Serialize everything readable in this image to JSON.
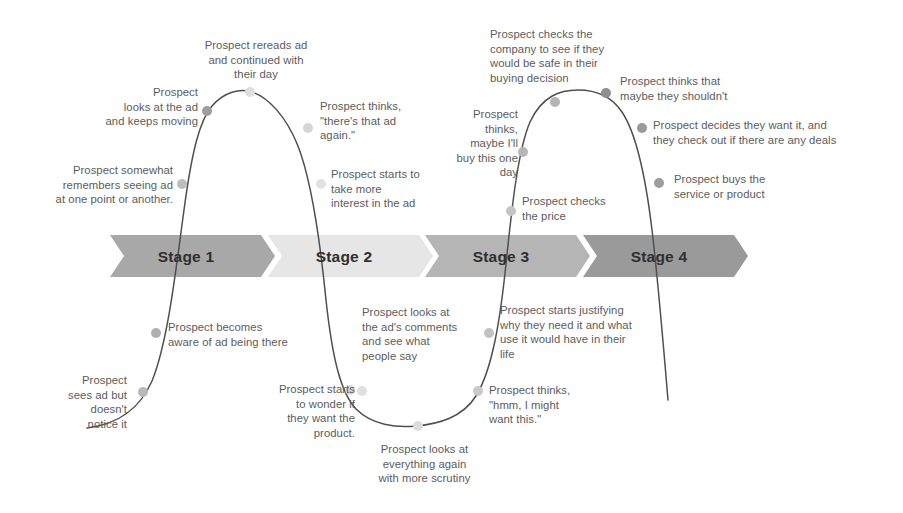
{
  "diagram": {
    "type": "customer-journey-stages",
    "background_color": "#ffffff",
    "curve_color": "#4f4f4f",
    "annotation_text_color": "#5c5c5c",
    "stage_label_color": "#2f2f2f"
  },
  "stages": [
    {
      "label": "Stage 1",
      "fill": "#a8a8a8",
      "x": 110,
      "width": 165,
      "label_x": 186,
      "label_y": 248
    },
    {
      "label": "Stage 2",
      "fill": "#e6e6e6",
      "x": 268,
      "width": 165,
      "label_x": 344,
      "label_y": 248
    },
    {
      "label": "Stage 3",
      "fill": "#b5b5b5",
      "x": 425,
      "width": 165,
      "label_x": 501,
      "label_y": 248
    },
    {
      "label": "Stage 4",
      "fill": "#9a9a9a",
      "x": 583,
      "width": 165,
      "label_x": 659,
      "label_y": 248
    }
  ],
  "banner": {
    "top": 235,
    "height": 42,
    "notch": 14
  },
  "annotations": [
    {
      "id": "sees-ad-but-doesnt-notice",
      "text": "Prospect\nsees ad but\ndoesn't\nnotice it",
      "align": "right",
      "x": 12,
      "y": 373,
      "width": 115
    },
    {
      "id": "becomes-aware-of-ad",
      "text": "Prospect becomes\naware of ad being there",
      "align": "left",
      "x": 168,
      "y": 320,
      "width": 185
    },
    {
      "id": "somewhat-remembers-seeing-ad",
      "text": "Prospect somewhat\nremembers seeing ad\nat one point or another.",
      "align": "right",
      "x": 28,
      "y": 163,
      "width": 145
    },
    {
      "id": "looks-at-ad-keeps-moving",
      "text": "Prospect\nlooks at the  ad\nand keeps moving",
      "align": "right",
      "x": 72,
      "y": 85,
      "width": 126
    },
    {
      "id": "rereads-ad-continued-day",
      "text": "Prospect rereads ad\nand continued with\ntheir day",
      "align": "center",
      "x": 186,
      "y": 38,
      "width": 140
    },
    {
      "id": "theres-that-ad-again",
      "text": "Prospect thinks,\n\"there's that ad\nagain.\"",
      "align": "left",
      "x": 320,
      "y": 99,
      "width": 120
    },
    {
      "id": "starts-to-take-more-interest",
      "text": "Prospect starts to\ntake more\ninterest in the ad",
      "align": "left",
      "x": 331,
      "y": 167,
      "width": 125
    },
    {
      "id": "starts-to-wonder-if-want-product",
      "text": "Prospect starts\nto wonder if\nthey want the\nproduct.",
      "align": "right",
      "x": 245,
      "y": 382,
      "width": 110
    },
    {
      "id": "looks-at-ads-comments",
      "text": "Prospect looks at\nthe ad's comments\nand see what\npeople say",
      "align": "left",
      "x": 362,
      "y": 305,
      "width": 130
    },
    {
      "id": "looks-at-everything-again",
      "text": "Prospect looks at\neverything again\nwith more scrutiny",
      "align": "center",
      "x": 362,
      "y": 442,
      "width": 125
    },
    {
      "id": "hmm-i-might-want-this",
      "text": "Prospect thinks,\n\"hmm, I might\nwant this.\"",
      "align": "left",
      "x": 489,
      "y": 383,
      "width": 125
    },
    {
      "id": "starts-justifying-why-need-it",
      "text": "Prospect starts  justifying\nwhy they need it and what\nuse it would have in their\nlife",
      "align": "left",
      "x": 500,
      "y": 303,
      "width": 180
    },
    {
      "id": "checks-the-price",
      "text": "Prospect checks\nthe price",
      "align": "left",
      "x": 522,
      "y": 194,
      "width": 115
    },
    {
      "id": "maybe-ill-buy-this-one-day",
      "text": "Prospect\nthinks,\nmaybe I'll\nbuy this one\nday",
      "align": "right",
      "x": 438,
      "y": 107,
      "width": 80
    },
    {
      "id": "checks-company-safe-buying-decision",
      "text": "Prospect checks the\ncompany to see if they\nwould be safe in their\nbuying decision",
      "align": "left",
      "x": 490,
      "y": 27,
      "width": 160
    },
    {
      "id": "thinks-maybe-they-shouldnt",
      "text": "Prospect thinks that\nmaybe they shouldn't",
      "align": "left",
      "x": 620,
      "y": 74,
      "width": 160
    },
    {
      "id": "decides-they-want-it-check-deals",
      "text": "Prospect decides they want it, and\nthey check out if there are any deals",
      "align": "left",
      "x": 653,
      "y": 118,
      "width": 240
    },
    {
      "id": "buys-the-service-or-product",
      "text": "Prospect buys the\nservice or product",
      "align": "left",
      "x": 674,
      "y": 172,
      "width": 140
    }
  ],
  "curve": {
    "path": "M 87 428 C 120 424 140 408 152 381 C 168 342 176 268 184 210 C 192 150 200 120 212 106 C 224 92 240 88 252 92 C 268 97 286 116 298 146 C 312 182 320 240 326 300 C 332 355 340 392 356 409 C 372 425 396 428 416 426 C 438 424 462 418 476 396 C 492 370 500 322 506 264 C 512 206 518 150 530 122 C 542 96 560 90 578 90 C 594 90 610 94 622 112 C 636 133 646 180 652 230 C 658 280 664 352 668 400",
    "points": [
      {
        "id": "sees-ad-but-doesnt-notice",
        "cx": 143,
        "cy": 392,
        "fill": "#b9b9b9"
      },
      {
        "id": "becomes-aware-of-ad",
        "cx": 156,
        "cy": 333,
        "fill": "#b0b0b0"
      },
      {
        "id": "somewhat-remembers-seeing-ad",
        "cx": 182,
        "cy": 184,
        "fill": "#bdbdbd"
      },
      {
        "id": "looks-at-ad-keeps-moving",
        "cx": 207,
        "cy": 111,
        "fill": "#9e9e9e"
      },
      {
        "id": "rereads-ad-continued-day",
        "cx": 250,
        "cy": 92,
        "fill": "#dedede"
      },
      {
        "id": "theres-that-ad-again",
        "cx": 308,
        "cy": 128,
        "fill": "#d6d6d6"
      },
      {
        "id": "starts-to-take-more-interest",
        "cx": 321,
        "cy": 184,
        "fill": "#e2e2e2"
      },
      {
        "id": "looks-at-ads-comments",
        "cx": 350,
        "cy": 390,
        "fill": "#d9d9d9"
      },
      {
        "id": "starts-to-wonder-if-want-product",
        "cx": 362,
        "cy": 391,
        "fill": "#e0e0e0"
      },
      {
        "id": "looks-at-everything-again",
        "cx": 418,
        "cy": 426,
        "fill": "#dcdcdc"
      },
      {
        "id": "hmm-i-might-want-this",
        "cx": 478,
        "cy": 391,
        "fill": "#c9c9c9"
      },
      {
        "id": "starts-justifying-why-need-it",
        "cx": 489,
        "cy": 333,
        "fill": "#c2c2c2"
      },
      {
        "id": "checks-the-price",
        "cx": 511,
        "cy": 211,
        "fill": "#c4c4c4"
      },
      {
        "id": "maybe-ill-buy-this-one-day",
        "cx": 523,
        "cy": 152,
        "fill": "#b6b6b6"
      },
      {
        "id": "checks-company-safe-buying-decision",
        "cx": 555,
        "cy": 102,
        "fill": "#b4b4b4"
      },
      {
        "id": "thinks-maybe-they-shouldnt",
        "cx": 606,
        "cy": 93,
        "fill": "#8f8f8f"
      },
      {
        "id": "decides-they-want-it-check-deals",
        "cx": 642,
        "cy": 128,
        "fill": "#9a9a9a"
      },
      {
        "id": "buys-the-service-or-product",
        "cx": 659,
        "cy": 183,
        "fill": "#9e9e9e"
      }
    ]
  }
}
